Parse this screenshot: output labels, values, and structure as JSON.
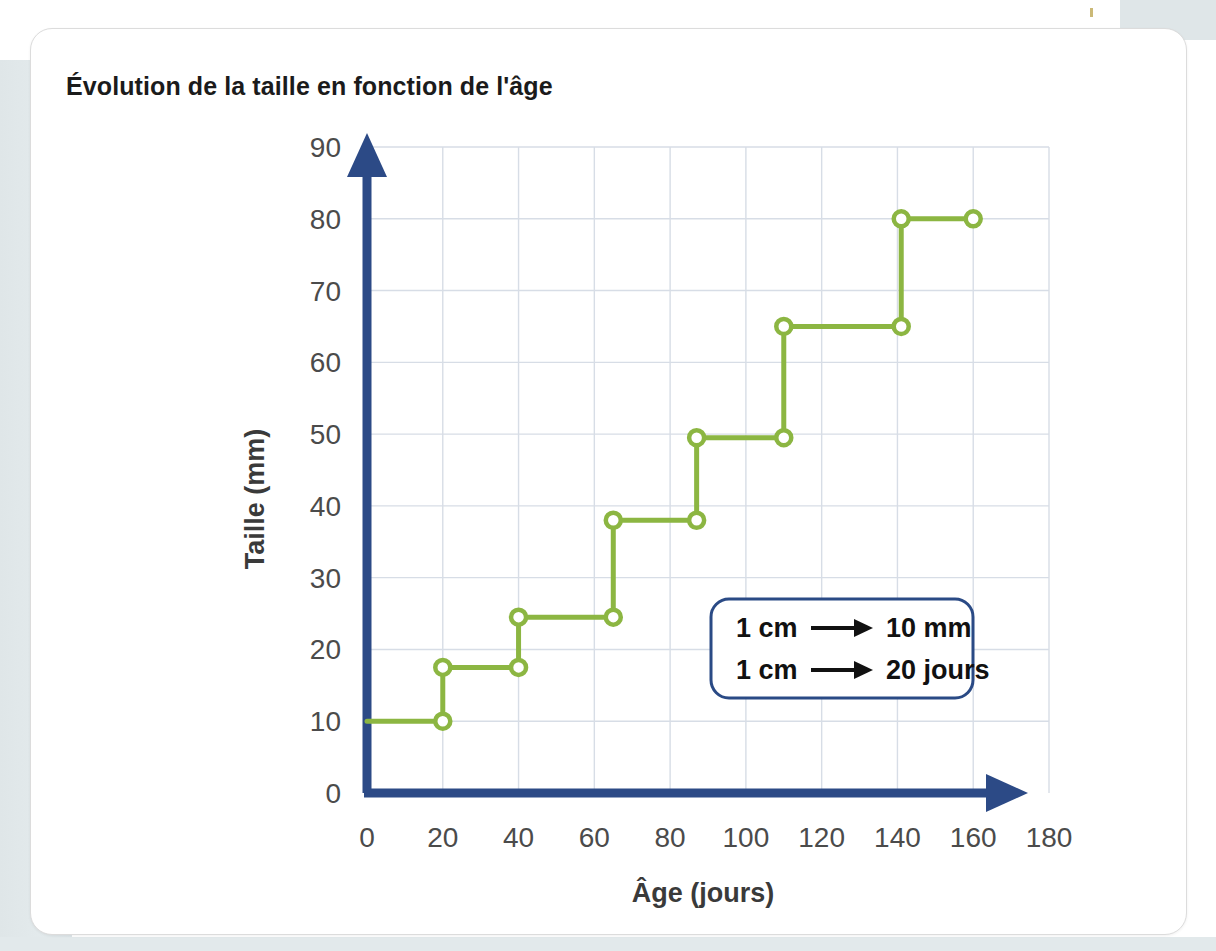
{
  "page": {
    "title": "Évolution de la taille en fonction de l'âge"
  },
  "legend_box": {
    "line1_left": "1 cm",
    "line1_right": "10 mm",
    "line2_left": "1 cm",
    "line2_right": "20 jours",
    "arrow_glyph": "→",
    "border_color": "#2a4a85"
  },
  "colors": {
    "axis": "#2c4a86",
    "series": "#8cb642",
    "grid": "#d7dde6",
    "title_text": "#1b1b1b",
    "tick_text": "#4b4b4b",
    "card_bg": "#ffffff",
    "page_bg": "#ffffff",
    "strip_grey": "#dfe6e8"
  },
  "chart_data": {
    "type": "line",
    "title": "Évolution de la taille en fonction de l'âge",
    "xlabel": "Âge (jours)",
    "ylabel": "Taille (mm)",
    "xlim": [
      0,
      180
    ],
    "ylim": [
      0,
      90
    ],
    "xticks": [
      0,
      20,
      40,
      60,
      80,
      100,
      120,
      140,
      160,
      180
    ],
    "yticks": [
      0,
      10,
      20,
      30,
      40,
      50,
      60,
      70,
      80,
      90
    ],
    "xtick_labels": [
      "0",
      "20",
      "40",
      "60",
      "80",
      "100",
      "120",
      "140",
      "160",
      "180"
    ],
    "ytick_labels": [
      "0",
      "10",
      "20",
      "30",
      "40",
      "50",
      "60",
      "70",
      "80",
      "90"
    ],
    "grid": true,
    "legend": "none",
    "step_style": "post",
    "annotations": [
      "1 cm → 10 mm",
      "1 cm → 20 jours"
    ],
    "series": [
      {
        "name": "Taille",
        "marker": "open-circle",
        "color": "#8cb642",
        "points": [
          {
            "x": 0,
            "y": 10.0
          },
          {
            "x": 20,
            "y": 10.0
          },
          {
            "x": 20,
            "y": 17.5
          },
          {
            "x": 40,
            "y": 17.5
          },
          {
            "x": 40,
            "y": 24.5
          },
          {
            "x": 65,
            "y": 24.5
          },
          {
            "x": 65,
            "y": 38.0
          },
          {
            "x": 87,
            "y": 38.0
          },
          {
            "x": 87,
            "y": 49.5
          },
          {
            "x": 110,
            "y": 49.5
          },
          {
            "x": 110,
            "y": 65.0
          },
          {
            "x": 141,
            "y": 65.0
          },
          {
            "x": 141,
            "y": 80.0
          },
          {
            "x": 160,
            "y": 80.0
          }
        ],
        "markers": [
          {
            "x": 20,
            "y": 10.0
          },
          {
            "x": 20,
            "y": 17.5
          },
          {
            "x": 40,
            "y": 17.5
          },
          {
            "x": 40,
            "y": 24.5
          },
          {
            "x": 65,
            "y": 24.5
          },
          {
            "x": 65,
            "y": 38.0
          },
          {
            "x": 87,
            "y": 38.0
          },
          {
            "x": 87,
            "y": 49.5
          },
          {
            "x": 110,
            "y": 49.5
          },
          {
            "x": 110,
            "y": 65.0
          },
          {
            "x": 141,
            "y": 65.0
          },
          {
            "x": 141,
            "y": 80.0
          },
          {
            "x": 160,
            "y": 80.0
          }
        ],
        "plateaus": [
          {
            "from_x": 0,
            "to_x": 20,
            "value": 10.0
          },
          {
            "from_x": 20,
            "to_x": 40,
            "value": 17.5
          },
          {
            "from_x": 40,
            "to_x": 65,
            "value": 24.5
          },
          {
            "from_x": 65,
            "to_x": 87,
            "value": 38.0
          },
          {
            "from_x": 87,
            "to_x": 110,
            "value": 49.5
          },
          {
            "from_x": 110,
            "to_x": 141,
            "value": 65.0
          },
          {
            "from_x": 141,
            "to_x": 160,
            "value": 80.0
          }
        ]
      }
    ]
  }
}
